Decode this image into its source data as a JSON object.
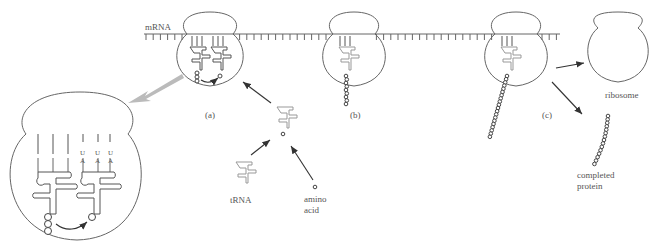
{
  "diagram": {
    "labels": {
      "mrna": "mRNA",
      "stage_a": "(a)",
      "stage_b": "(b)",
      "stage_c": "(c)",
      "trna": "tRNA",
      "amino_acid_line1": "amino",
      "amino_acid_line2": "acid",
      "ribosome": "ribosome",
      "completed_protein_line1": "completed",
      "completed_protein_line2": "protein"
    },
    "codon_bases": [
      "U",
      "U",
      "U"
    ],
    "anticodon_bases": [
      "A",
      "A",
      "A"
    ],
    "colors": {
      "outline": "#666666",
      "trna": "#999999",
      "zoom_arrow": "#bbbbbb",
      "text": "#555555"
    }
  }
}
